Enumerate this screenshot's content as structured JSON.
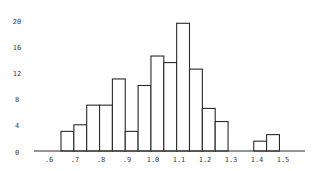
{
  "chart_data": {
    "type": "bar",
    "subtype": "histogram",
    "title": "",
    "xlabel": "",
    "ylabel": "",
    "bin_width": 0.05,
    "bins": [
      {
        "start": 0.65,
        "end": 0.7,
        "count": 3
      },
      {
        "start": 0.7,
        "end": 0.75,
        "count": 4
      },
      {
        "start": 0.75,
        "end": 0.8,
        "count": 7
      },
      {
        "start": 0.8,
        "end": 0.85,
        "count": 7
      },
      {
        "start": 0.85,
        "end": 0.9,
        "count": 11
      },
      {
        "start": 0.9,
        "end": 0.95,
        "count": 3
      },
      {
        "start": 0.95,
        "end": 1.0,
        "count": 10
      },
      {
        "start": 1.0,
        "end": 1.05,
        "count": 14.5
      },
      {
        "start": 1.05,
        "end": 1.1,
        "count": 13.5
      },
      {
        "start": 1.1,
        "end": 1.15,
        "count": 19.5
      },
      {
        "start": 1.15,
        "end": 1.2,
        "count": 12.5
      },
      {
        "start": 1.2,
        "end": 1.25,
        "count": 6.5
      },
      {
        "start": 1.25,
        "end": 1.3,
        "count": 4.5
      },
      {
        "start": 1.3,
        "end": 1.35,
        "count": 0
      },
      {
        "start": 1.35,
        "end": 1.4,
        "count": 0
      },
      {
        "start": 1.4,
        "end": 1.45,
        "count": 1.5
      },
      {
        "start": 1.45,
        "end": 1.5,
        "count": 2.5
      }
    ],
    "x_ticks": [
      0.6,
      0.7,
      0.8,
      0.9,
      1.0,
      1.1,
      1.2,
      1.3,
      1.4,
      1.5
    ],
    "x_tick_labels": [
      ".6",
      ".7",
      ".8",
      ".9",
      "1.0",
      "1.1",
      "1.2",
      "1.3",
      "1.4",
      "1.5"
    ],
    "y_ticks": [
      0,
      4,
      8,
      12,
      16,
      20
    ],
    "y_tick_labels": [
      "0",
      "4",
      "8",
      "12",
      "16",
      "20"
    ],
    "xlim": [
      0.55,
      1.6
    ],
    "ylim": [
      0,
      20
    ],
    "grid": false,
    "legend": null,
    "colors": {
      "bar_fill": "#ffffff",
      "bar_stroke": "#2a2a2a",
      "text": "#3a3a3a"
    }
  }
}
